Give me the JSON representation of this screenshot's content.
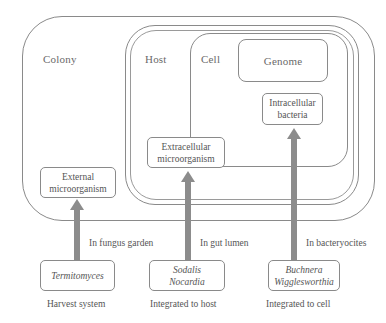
{
  "diagram": {
    "containers": {
      "colony": "Colony",
      "host": "Host",
      "cell": "Cell",
      "genome": "Genome"
    },
    "inner_boxes": {
      "intracellular": [
        "Intracellular",
        "bacteria"
      ],
      "extracellular": [
        "Extracellular",
        "microorganism"
      ],
      "external": [
        "External",
        "microorganism"
      ]
    },
    "arrow_labels": {
      "fungus": "In fungus garden",
      "gut": "In gut lumen",
      "bacteriocytes": "In bacteryocites"
    },
    "organisms": {
      "harvest": [
        "Termitomyces"
      ],
      "host": [
        "Sodalis",
        "Nocardia"
      ],
      "cell": [
        "Buchnera",
        "Wigglesworthia"
      ]
    },
    "categories": {
      "harvest": "Harvest system",
      "host": "Integrated to host",
      "cell": "Integrated to cell"
    },
    "colors": {
      "line": "#8a8a8a",
      "arrow": "#8c8c8c"
    }
  }
}
